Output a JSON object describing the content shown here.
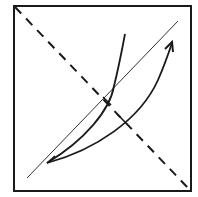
{
  "diagram": {
    "colors": {
      "stroke": "#1a1a1a",
      "background": "#ffffff"
    },
    "frame": {
      "x": 14,
      "y": 6,
      "width": 177,
      "height": 185
    },
    "dashed_diagonal": {
      "x1": 14,
      "y1": 6,
      "x2": 191,
      "y2": 191
    },
    "thin_diagonal": {
      "x1": 27,
      "y1": 178,
      "x2": 178,
      "y2": 21
    },
    "steep_curve": {
      "start": [
        47,
        163
      ],
      "end": [
        125,
        34
      ]
    },
    "arrow_curve": {
      "start": [
        47,
        163
      ],
      "end": [
        172,
        42
      ],
      "arrowhead": true
    },
    "tick_marks": [
      {
        "at": [
          108,
          102
        ]
      },
      {
        "at": [
          122,
          118
        ]
      }
    ]
  }
}
